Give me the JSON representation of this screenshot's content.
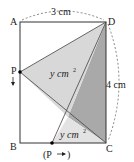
{
  "figure": {
    "vertices": {
      "A": "A",
      "B": "B",
      "C": "C",
      "D": "D"
    },
    "moving_point": "P",
    "moving_point_bottom": "(P",
    "moving_point_bottom_close": ")",
    "area_label_top": "y cm",
    "area_label_bottom": "y cm",
    "area_exp": "2",
    "width_label": "3 cm",
    "height_label": "4 cm",
    "colors": {
      "light_fill": "#d6d6d6",
      "dark_fill": "#a9a9a9",
      "pale_fill": "#e4e4e4",
      "line": "#333333"
    }
  }
}
